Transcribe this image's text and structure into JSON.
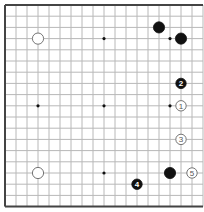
{
  "board": {
    "size": 19,
    "origin_x": 5,
    "origin_y": 5,
    "step_x": 11,
    "step_y": 11.2,
    "line_color": "#b8b8b8",
    "border_color": "#444444",
    "star_points": [
      [
        3,
        3
      ],
      [
        9,
        3
      ],
      [
        15,
        3
      ],
      [
        3,
        9
      ],
      [
        9,
        9
      ],
      [
        15,
        9
      ],
      [
        3,
        15
      ],
      [
        9,
        15
      ],
      [
        15,
        15
      ]
    ]
  },
  "stones": [
    {
      "color": "white",
      "col": 3,
      "row": 3,
      "label": ""
    },
    {
      "color": "black",
      "col": 14,
      "row": 2,
      "label": ""
    },
    {
      "color": "black",
      "col": 16,
      "row": 3,
      "label": ""
    },
    {
      "color": "white",
      "col": 16,
      "row": 9,
      "label": "1"
    },
    {
      "color": "black",
      "col": 16,
      "row": 7,
      "label": "2"
    },
    {
      "color": "white",
      "col": 16,
      "row": 12,
      "label": "3"
    },
    {
      "color": "black",
      "col": 12,
      "row": 16,
      "label": "4"
    },
    {
      "color": "white",
      "col": 17,
      "row": 15,
      "label": "5"
    },
    {
      "color": "white",
      "col": 3,
      "row": 15,
      "label": ""
    },
    {
      "color": "black",
      "col": 15,
      "row": 15,
      "label": ""
    }
  ]
}
